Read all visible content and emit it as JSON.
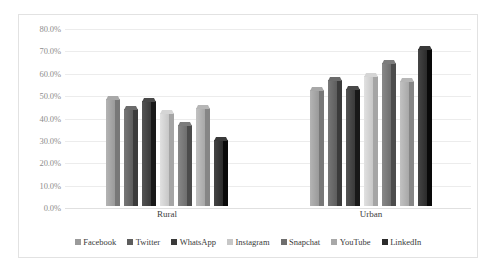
{
  "chart_data": {
    "type": "bar",
    "title": "",
    "subtitle": "",
    "xlabel": "",
    "ylabel": "",
    "categories": [
      "Rural",
      "Urban"
    ],
    "series": [
      {
        "name": "Facebook",
        "values": [
          48.0,
          52.0
        ],
        "color": "#9a9a9a"
      },
      {
        "name": "Twitter",
        "values": [
          43.5,
          56.5
        ],
        "color": "#5d5d5d"
      },
      {
        "name": "WhatsApp",
        "values": [
          47.0,
          52.5
        ],
        "color": "#3a3a3a"
      },
      {
        "name": "Instagram",
        "values": [
          41.5,
          58.0
        ],
        "color": "#c7c7c7"
      },
      {
        "name": "Snapchat",
        "values": [
          36.0,
          64.0
        ],
        "color": "#6e6e6e"
      },
      {
        "name": "YouTube",
        "values": [
          44.0,
          56.0
        ],
        "color": "#a8a8a8"
      },
      {
        "name": "LinkedIn",
        "values": [
          29.5,
          70.0
        ],
        "color": "#2b2b2b"
      }
    ],
    "ylim": [
      0,
      80
    ],
    "ytick_step": 10,
    "ytick_labels": [
      "0.0%",
      "10.0%",
      "20.0%",
      "30.0%",
      "40.0%",
      "50.0%",
      "60.0%",
      "70.0%",
      "80.0%"
    ],
    "grid": true,
    "grid_axis": "y",
    "legend_position": "bottom",
    "plot_style": "3d-columns",
    "border": true,
    "background_color": "#ffffff",
    "gridline_color": "#ececec"
  },
  "legend": {
    "items": [
      {
        "label": "Facebook"
      },
      {
        "label": "Twitter"
      },
      {
        "label": "WhatsApp"
      },
      {
        "label": "Instagram"
      },
      {
        "label": "Snapchat"
      },
      {
        "label": "YouTube"
      },
      {
        "label": "LinkedIn"
      }
    ]
  }
}
